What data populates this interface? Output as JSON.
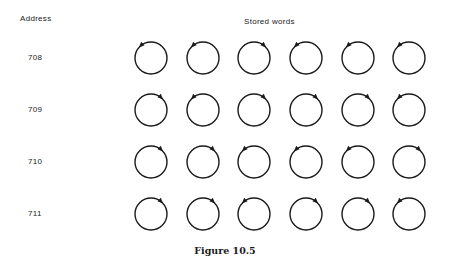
{
  "headers": {
    "address": "Address",
    "stored_words": "Stored words"
  },
  "rows": [
    {
      "address": "708",
      "y": 58,
      "arrows": [
        "L",
        "L",
        "R",
        "L",
        "L",
        "L"
      ]
    },
    {
      "address": "709",
      "y": 110,
      "arrows": [
        "R",
        "L",
        "R",
        "R",
        "R",
        "L"
      ]
    },
    {
      "address": "710",
      "y": 162,
      "arrows": [
        "R",
        "R",
        "L",
        "L",
        "L",
        "R"
      ]
    },
    {
      "address": "711",
      "y": 214,
      "arrows": [
        "R",
        "R",
        "L",
        "R",
        "R",
        "L"
      ]
    }
  ],
  "columns_x": [
    151,
    203,
    254,
    306,
    358,
    409
  ],
  "core_radius": 16,
  "caption": "Figure 10.5",
  "colors": {
    "stroke": "#1a1a1a",
    "background": "#ffffff"
  }
}
